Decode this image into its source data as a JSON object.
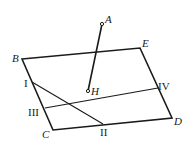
{
  "diagram": {
    "points": {
      "A": {
        "label": "A",
        "x": 102,
        "y": 24
      },
      "B": {
        "label": "B",
        "x": 22,
        "y": 59
      },
      "E": {
        "label": "E",
        "x": 140,
        "y": 48
      },
      "D": {
        "label": "D",
        "x": 172,
        "y": 118
      },
      "C": {
        "label": "C",
        "x": 53,
        "y": 130
      },
      "H": {
        "label": "H",
        "x": 88,
        "y": 91
      },
      "I": {
        "label": "I",
        "x": 32,
        "y": 82
      },
      "II": {
        "label": "II",
        "x": 103,
        "y": 124
      },
      "III": {
        "label": "III",
        "x": 45,
        "y": 108
      },
      "IV": {
        "label": "IV",
        "x": 158,
        "y": 88
      }
    },
    "segments": [
      {
        "from": "B",
        "to": "E"
      },
      {
        "from": "E",
        "to": "D"
      },
      {
        "from": "D",
        "to": "C"
      },
      {
        "from": "C",
        "to": "B"
      },
      {
        "from": "A",
        "to": "H"
      },
      {
        "from": "I",
        "to": "II"
      },
      {
        "from": "III",
        "to": "IV"
      }
    ]
  }
}
